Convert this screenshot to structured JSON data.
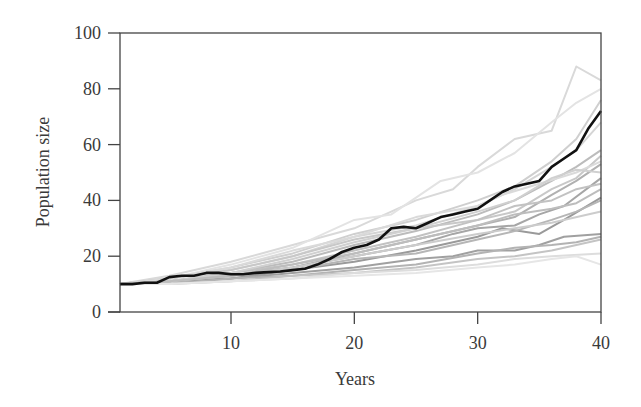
{
  "chart_data": {
    "type": "line",
    "title": "",
    "xlabel": "Years",
    "ylabel": "Population size",
    "xlim": [
      1,
      40
    ],
    "ylim": [
      0,
      100
    ],
    "xticks": [
      10,
      20,
      30,
      40
    ],
    "yticks": [
      0,
      20,
      40,
      60,
      80,
      100
    ],
    "grid": false,
    "legend": "none",
    "x": [
      1,
      5,
      10,
      15,
      20,
      25,
      30,
      35,
      40
    ],
    "highlight_series": {
      "name": "Highlighted run",
      "color": "#111111",
      "points": [
        [
          1,
          10
        ],
        [
          2,
          10
        ],
        [
          3,
          10.5
        ],
        [
          4,
          10.5
        ],
        [
          5,
          12.5
        ],
        [
          6,
          13
        ],
        [
          7,
          13
        ],
        [
          8,
          14
        ],
        [
          9,
          14
        ],
        [
          10,
          13.5
        ],
        [
          11,
          13.5
        ],
        [
          12,
          14
        ],
        [
          13,
          14.3
        ],
        [
          14,
          14.5
        ],
        [
          15,
          15
        ],
        [
          16,
          15.5
        ],
        [
          17,
          17
        ],
        [
          18,
          19
        ],
        [
          19,
          21.5
        ],
        [
          20,
          23
        ],
        [
          21,
          24
        ],
        [
          22,
          26
        ],
        [
          23,
          30
        ],
        [
          24,
          30.5
        ],
        [
          25,
          30
        ],
        [
          26,
          32
        ],
        [
          27,
          34
        ],
        [
          28,
          35
        ],
        [
          29,
          36
        ],
        [
          30,
          37
        ],
        [
          31,
          40
        ],
        [
          32,
          43
        ],
        [
          33,
          45
        ],
        [
          34,
          46
        ],
        [
          35,
          47
        ],
        [
          36,
          52
        ],
        [
          37,
          55
        ],
        [
          38,
          58
        ],
        [
          39,
          66
        ],
        [
          40,
          72
        ]
      ]
    },
    "series": [
      {
        "name": "run-1",
        "color": "#d9d9d9",
        "points": [
          [
            1,
            10
          ],
          [
            5,
            13
          ],
          [
            10,
            18
          ],
          [
            15,
            24
          ],
          [
            20,
            30
          ],
          [
            25,
            40
          ],
          [
            28,
            44
          ],
          [
            30,
            52
          ],
          [
            33,
            62
          ],
          [
            36,
            65
          ],
          [
            38,
            88
          ],
          [
            40,
            83
          ]
        ]
      },
      {
        "name": "run-2",
        "color": "#e3e3e3",
        "points": [
          [
            1,
            10
          ],
          [
            5,
            12
          ],
          [
            10,
            17
          ],
          [
            15,
            23
          ],
          [
            20,
            33
          ],
          [
            23,
            35
          ],
          [
            27,
            47
          ],
          [
            30,
            50
          ],
          [
            33,
            57
          ],
          [
            36,
            68
          ],
          [
            38,
            75
          ],
          [
            40,
            80
          ]
        ]
      },
      {
        "name": "run-3",
        "color": "#cfcfcf",
        "points": [
          [
            1,
            10
          ],
          [
            5,
            12
          ],
          [
            10,
            16
          ],
          [
            15,
            21
          ],
          [
            20,
            28
          ],
          [
            25,
            33
          ],
          [
            30,
            40
          ],
          [
            33,
            45
          ],
          [
            36,
            54
          ],
          [
            38,
            62
          ],
          [
            40,
            76
          ]
        ]
      },
      {
        "name": "run-4",
        "color": "#d5d5d5",
        "points": [
          [
            1,
            10
          ],
          [
            5,
            12
          ],
          [
            10,
            15
          ],
          [
            15,
            20
          ],
          [
            20,
            27
          ],
          [
            25,
            31
          ],
          [
            30,
            38
          ],
          [
            33,
            44
          ],
          [
            36,
            52
          ],
          [
            38,
            58
          ],
          [
            40,
            68
          ]
        ]
      },
      {
        "name": "run-5",
        "color": "#bcbcbc",
        "points": [
          [
            1,
            10
          ],
          [
            5,
            11
          ],
          [
            10,
            14
          ],
          [
            15,
            18
          ],
          [
            20,
            24
          ],
          [
            25,
            29
          ],
          [
            30,
            35
          ],
          [
            33,
            40
          ],
          [
            36,
            47
          ],
          [
            38,
            52
          ],
          [
            40,
            58
          ]
        ]
      },
      {
        "name": "run-6",
        "color": "#c8c8c8",
        "points": [
          [
            1,
            10
          ],
          [
            5,
            12
          ],
          [
            10,
            15
          ],
          [
            15,
            20
          ],
          [
            20,
            26
          ],
          [
            25,
            30
          ],
          [
            30,
            33
          ],
          [
            33,
            36
          ],
          [
            36,
            44
          ],
          [
            38,
            48
          ],
          [
            40,
            56
          ]
        ]
      },
      {
        "name": "run-7",
        "color": "#b0b0b0",
        "points": [
          [
            1,
            10
          ],
          [
            5,
            11
          ],
          [
            10,
            13
          ],
          [
            15,
            16
          ],
          [
            20,
            21
          ],
          [
            25,
            26
          ],
          [
            30,
            31
          ],
          [
            33,
            34
          ],
          [
            36,
            42
          ],
          [
            38,
            47
          ],
          [
            40,
            53
          ]
        ]
      },
      {
        "name": "run-8",
        "color": "#dadada",
        "points": [
          [
            1,
            10
          ],
          [
            5,
            12
          ],
          [
            10,
            16
          ],
          [
            15,
            22
          ],
          [
            20,
            27
          ],
          [
            25,
            34
          ],
          [
            30,
            38
          ],
          [
            32,
            42
          ],
          [
            35,
            46
          ],
          [
            38,
            50
          ],
          [
            40,
            54
          ]
        ]
      },
      {
        "name": "run-9",
        "color": "#a6a6a6",
        "points": [
          [
            1,
            10
          ],
          [
            5,
            11
          ],
          [
            10,
            13
          ],
          [
            15,
            16
          ],
          [
            20,
            20
          ],
          [
            25,
            24
          ],
          [
            28,
            28
          ],
          [
            30,
            30
          ],
          [
            33,
            31
          ],
          [
            35,
            35
          ],
          [
            37,
            38
          ],
          [
            40,
            48
          ]
        ]
      },
      {
        "name": "run-10",
        "color": "#c2c2c2",
        "points": [
          [
            1,
            10
          ],
          [
            5,
            11
          ],
          [
            10,
            14
          ],
          [
            15,
            17
          ],
          [
            20,
            22
          ],
          [
            25,
            27
          ],
          [
            30,
            33
          ],
          [
            33,
            38
          ],
          [
            36,
            40
          ],
          [
            38,
            44
          ],
          [
            40,
            46
          ]
        ]
      },
      {
        "name": "run-11",
        "color": "#9a9a9a",
        "points": [
          [
            1,
            10
          ],
          [
            5,
            11
          ],
          [
            10,
            12
          ],
          [
            15,
            15
          ],
          [
            20,
            18
          ],
          [
            25,
            22
          ],
          [
            30,
            27
          ],
          [
            32,
            30
          ],
          [
            35,
            28
          ],
          [
            37,
            33
          ],
          [
            40,
            41
          ]
        ]
      },
      {
        "name": "run-12",
        "color": "#b6b6b6",
        "points": [
          [
            1,
            10
          ],
          [
            5,
            11
          ],
          [
            10,
            13
          ],
          [
            15,
            15
          ],
          [
            20,
            19
          ],
          [
            25,
            21
          ],
          [
            30,
            26
          ],
          [
            33,
            29
          ],
          [
            36,
            33
          ],
          [
            38,
            36
          ],
          [
            40,
            40
          ]
        ]
      },
      {
        "name": "run-13",
        "color": "#cccccc",
        "points": [
          [
            1,
            10
          ],
          [
            5,
            11
          ],
          [
            10,
            13
          ],
          [
            15,
            16
          ],
          [
            20,
            20
          ],
          [
            25,
            24
          ],
          [
            30,
            28
          ],
          [
            33,
            30
          ],
          [
            36,
            32
          ],
          [
            40,
            36
          ]
        ]
      },
      {
        "name": "run-14",
        "color": "#a0a0a0",
        "points": [
          [
            1,
            10
          ],
          [
            5,
            10
          ],
          [
            10,
            12
          ],
          [
            15,
            14
          ],
          [
            20,
            16
          ],
          [
            25,
            19
          ],
          [
            28,
            20
          ],
          [
            30,
            22
          ],
          [
            33,
            22
          ],
          [
            35,
            24
          ],
          [
            37,
            27
          ],
          [
            40,
            28
          ]
        ]
      },
      {
        "name": "run-15",
        "color": "#b3b3b3",
        "points": [
          [
            1,
            10
          ],
          [
            5,
            10
          ],
          [
            10,
            12
          ],
          [
            15,
            13
          ],
          [
            20,
            15
          ],
          [
            25,
            17
          ],
          [
            30,
            21
          ],
          [
            33,
            23
          ],
          [
            36,
            24
          ],
          [
            38,
            25
          ],
          [
            40,
            27
          ]
        ]
      },
      {
        "name": "run-16",
        "color": "#c4c4c4",
        "points": [
          [
            1,
            10
          ],
          [
            5,
            10
          ],
          [
            10,
            11
          ],
          [
            15,
            13
          ],
          [
            20,
            14
          ],
          [
            25,
            16
          ],
          [
            30,
            19
          ],
          [
            33,
            20
          ],
          [
            36,
            22
          ],
          [
            40,
            26
          ]
        ]
      },
      {
        "name": "run-17",
        "color": "#dddddd",
        "points": [
          [
            1,
            10
          ],
          [
            5,
            10
          ],
          [
            10,
            11
          ],
          [
            15,
            12
          ],
          [
            20,
            14
          ],
          [
            25,
            15
          ],
          [
            30,
            17
          ],
          [
            33,
            19
          ],
          [
            36,
            20
          ],
          [
            40,
            21
          ]
        ]
      },
      {
        "name": "run-18",
        "color": "#e6e6e6",
        "points": [
          [
            1,
            10
          ],
          [
            5,
            10
          ],
          [
            10,
            11
          ],
          [
            15,
            12
          ],
          [
            20,
            13
          ],
          [
            25,
            14
          ],
          [
            30,
            16
          ],
          [
            33,
            17
          ],
          [
            36,
            19
          ],
          [
            38,
            20
          ],
          [
            40,
            17
          ]
        ]
      },
      {
        "name": "run-19",
        "color": "#d0d0d0",
        "points": [
          [
            1,
            10
          ],
          [
            5,
            11
          ],
          [
            10,
            14
          ],
          [
            15,
            19
          ],
          [
            20,
            25
          ],
          [
            25,
            30
          ],
          [
            30,
            36
          ],
          [
            33,
            40
          ],
          [
            36,
            48
          ],
          [
            38,
            51
          ],
          [
            40,
            50
          ]
        ]
      },
      {
        "name": "run-20",
        "color": "#bdbdbd",
        "points": [
          [
            1,
            10
          ],
          [
            5,
            11
          ],
          [
            10,
            13
          ],
          [
            15,
            17
          ],
          [
            20,
            21
          ],
          [
            25,
            26
          ],
          [
            30,
            31
          ],
          [
            33,
            35
          ],
          [
            36,
            37
          ],
          [
            38,
            39
          ],
          [
            40,
            44
          ]
        ]
      }
    ]
  },
  "axes": {
    "x_title": "Years",
    "y_title": "Population size",
    "x_tick_labels": [
      "10",
      "20",
      "30",
      "40"
    ],
    "y_tick_labels": [
      "0",
      "20",
      "40",
      "60",
      "80",
      "100"
    ]
  }
}
